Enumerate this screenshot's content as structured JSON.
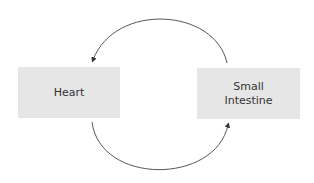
{
  "diagram": {
    "nodes": [
      {
        "id": "heart",
        "label": "Heart"
      },
      {
        "id": "small_intestine",
        "label": "Small\nIntestine",
        "label_line1": "Small",
        "label_line2": "Intestine"
      }
    ],
    "edges": [
      {
        "from": "small_intestine",
        "to": "heart",
        "style": "curved-arrow-top"
      },
      {
        "from": "heart",
        "to": "small_intestine",
        "style": "curved-arrow-bottom"
      }
    ],
    "colors": {
      "box_fill": "#e6e6e6",
      "text": "#333333",
      "arrow": "#333333"
    }
  }
}
